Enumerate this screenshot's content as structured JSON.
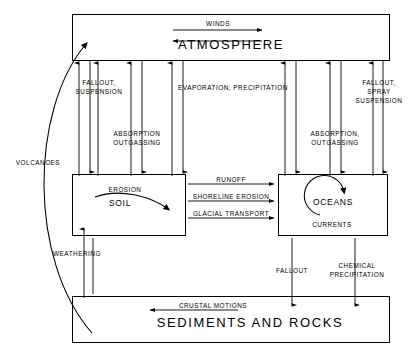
{
  "diagram": {
    "stroke_color": "#000000",
    "background_color": "#ffffff",
    "boxes": [
      {
        "id": "atmosphere",
        "label": "ATMOSPHERE",
        "x": 72,
        "y": 14,
        "w": 318,
        "h": 47
      },
      {
        "id": "soil",
        "label": "SOIL",
        "x": 72,
        "y": 174,
        "w": 114,
        "h": 62
      },
      {
        "id": "oceans",
        "label": "OCEANS",
        "x": 278,
        "y": 174,
        "w": 110,
        "h": 62
      },
      {
        "id": "sediments",
        "label": "SEDIMENTS AND ROCKS",
        "x": 72,
        "y": 296,
        "w": 318,
        "h": 47
      }
    ],
    "flux_labels": [
      {
        "id": "winds",
        "text": "WINDS"
      },
      {
        "id": "fallout-suspension",
        "text": "FALLOUT,\nSUSPENSION"
      },
      {
        "id": "evaporation-precipitation",
        "text": "EVAPORATION, PRECIPITATION"
      },
      {
        "id": "fallout-spray-suspension",
        "text": "FALLOUT,\nSPRAY\nSUSPENSION"
      },
      {
        "id": "absorption-outgassing-left",
        "text": "ABSORPTION\nOUTGASSING"
      },
      {
        "id": "absorption-outgassing-right",
        "text": "ABSORPTION,\nOUTGASSING"
      },
      {
        "id": "volcanoes",
        "text": "VOLCANOES"
      },
      {
        "id": "erosion",
        "text": "EROSION"
      },
      {
        "id": "runoff",
        "text": "RUNOFF"
      },
      {
        "id": "shoreline-erosion",
        "text": "SHORELINE EROSION"
      },
      {
        "id": "glacial-transport",
        "text": "GLACIAL TRANSPORT"
      },
      {
        "id": "currents",
        "text": "CURRENTS"
      },
      {
        "id": "weathering",
        "text": "WEATHERING"
      },
      {
        "id": "fallout",
        "text": "FALLOUT"
      },
      {
        "id": "chemical-precipitation",
        "text": "CHEMICAL\nPRECIPITATION"
      },
      {
        "id": "crustal-motions",
        "text": "CRUSTAL MOTIONS"
      }
    ]
  },
  "labels": {
    "atmosphere": "ATMOSPHERE",
    "soil": "SOIL",
    "oceans": "OCEANS",
    "sediments": "SEDIMENTS AND ROCKS",
    "winds": "WINDS",
    "fallout_suspension_l1": "FALLOUT,",
    "fallout_suspension_l2": "SUSPENSION",
    "evaporation_precipitation": "EVAPORATION, PRECIPITATION",
    "fallout_spray_l1": "FALLOUT,",
    "fallout_spray_l2": "SPRAY",
    "fallout_spray_l3": "SUSPENSION",
    "absorption_left_l1": "ABSORPTION",
    "absorption_left_l2": "OUTGASSING",
    "absorption_right_l1": "ABSORPTION,",
    "absorption_right_l2": "OUTGASSING",
    "volcanoes": "VOLCANOES",
    "erosion": "EROSION",
    "runoff": "RUNOFF",
    "shoreline_erosion": "SHORELINE EROSION",
    "glacial_transport": "GLACIAL TRANSPORT",
    "currents": "CURRENTS",
    "weathering": "WEATHERING",
    "fallout": "FALLOUT",
    "chemical_precipitation_l1": "CHEMICAL",
    "chemical_precipitation_l2": "PRECIPITATION",
    "crustal_motions": "CRUSTAL MOTIONS"
  }
}
